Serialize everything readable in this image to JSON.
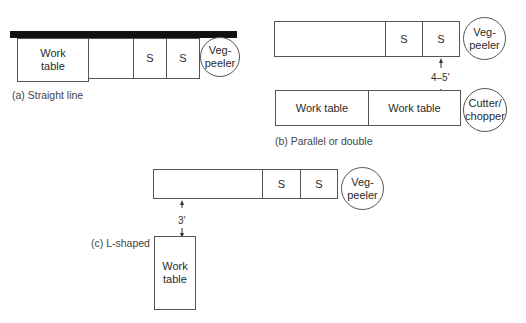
{
  "diagrams": {
    "a": {
      "caption": "(a) Straight line",
      "work_table": "Work\ntable",
      "sink1": "S",
      "sink2": "S",
      "peeler": "Veg-\npeeler"
    },
    "b": {
      "caption": "(b) Parallel or double",
      "sink1": "S",
      "sink2": "S",
      "peeler": "Veg-\npeeler",
      "clearance": "4–5'",
      "work_table1": "Work table",
      "work_table2": "Work table",
      "cutter": "Cutter/\nchopper"
    },
    "c": {
      "caption": "(c) L-shaped",
      "sink1": "S",
      "sink2": "S",
      "peeler": "Veg-\npeeler",
      "clearance": "3'",
      "work_table": "Work\ntable"
    }
  }
}
